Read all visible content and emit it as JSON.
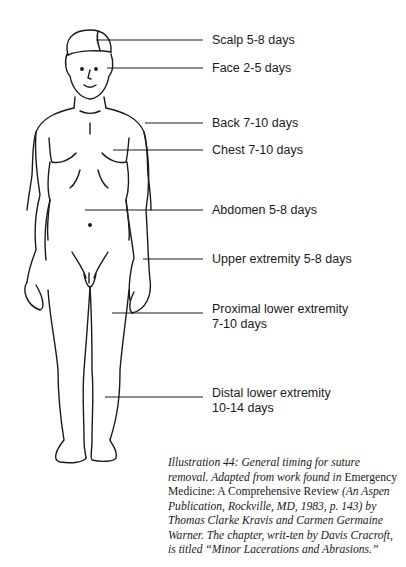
{
  "labels": {
    "scalp": "Scalp 5-8 days",
    "face": "Face 2-5 days",
    "back": "Back 7-10 days",
    "chest": "Chest 7-10 days",
    "abdomen": "Abdomen 5-8 days",
    "upper_extremity": "Upper extremity 5-8 days",
    "proximal_lower_line1": "Proximal lower extremity",
    "proximal_lower_line2": "7-10 days",
    "distal_lower_line1": "Distal lower extremity",
    "distal_lower_line2": "10-14 days"
  },
  "caption": {
    "part1_italic": "Illustration 44: General timing for suture removal. Adapted from work found in",
    "part2_roman": "Emergency Medicine: A Comprehensive Review",
    "part3_italic": "(An Aspen Publication, Rockville, MD, 1983, p. 143) by Thomas Clarke Kravis and Carmen Germaine Warner. The chapter, writ-ten by Davis Cracroft, is titled “Minor Lacerations and Abrasions.”"
  },
  "colors": {
    "ink": "#1a1a1a",
    "background": "#ffffff"
  }
}
